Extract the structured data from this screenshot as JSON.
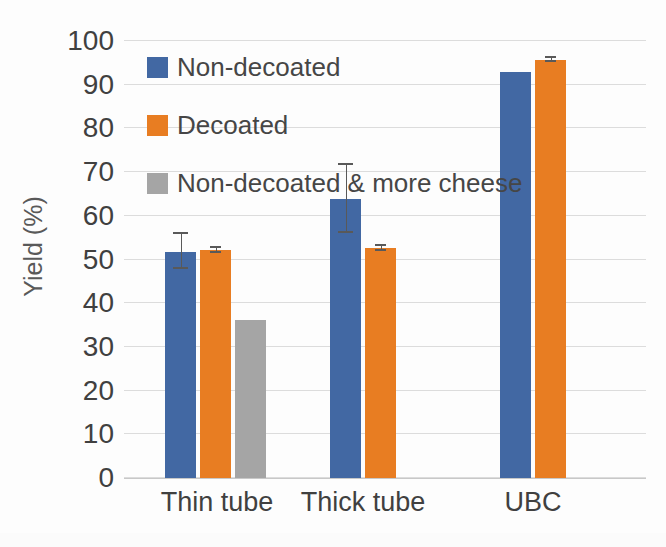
{
  "chart_data": {
    "type": "bar",
    "title": "",
    "xlabel": "",
    "ylabel": "Yield (%)",
    "ylim": [
      0,
      100
    ],
    "ytick_step": 10,
    "yticks": [
      "100",
      "90",
      "80",
      "70",
      "60",
      "50",
      "40",
      "30",
      "20",
      "10",
      "0"
    ],
    "grid": true,
    "legend_position": "inside-top-left",
    "categories": [
      "Thin tube",
      "Thick tube",
      "UBC"
    ],
    "series": [
      {
        "name": "Non-decoated",
        "color": "#4268A3",
        "values": [
          51.8,
          63.9,
          93.0
        ],
        "errors": [
          4.0,
          7.8,
          0
        ]
      },
      {
        "name": "Decoated",
        "color": "#E87D22",
        "values": [
          52.1,
          52.6,
          95.6
        ],
        "errors": [
          0.5,
          0.6,
          0.5
        ]
      },
      {
        "name": "Non-decoated & more cheese",
        "color": "#A5A5A5",
        "values": [
          36.2,
          null,
          null
        ],
        "errors": [
          0,
          null,
          null
        ]
      }
    ]
  },
  "axis": {
    "y_title": "Yield (%)"
  },
  "legend": {
    "items": [
      {
        "label": "Non-decoated",
        "color": "#4268A3",
        "swatch": "legend-swatch-non-decoated"
      },
      {
        "label": "Decoated",
        "color": "#E87D22",
        "swatch": "legend-swatch-decoated"
      },
      {
        "label": "Non-decoated & more cheese",
        "color": "#A5A5A5",
        "swatch": "legend-swatch-non-decoated-more-cheese"
      }
    ]
  },
  "colors": {
    "series_blue": "#4268A3",
    "series_orange": "#E87D22",
    "series_grey": "#A5A5A5",
    "gridline": "#DCDCDC",
    "text": "#404040",
    "background": "#FDFDFD"
  }
}
